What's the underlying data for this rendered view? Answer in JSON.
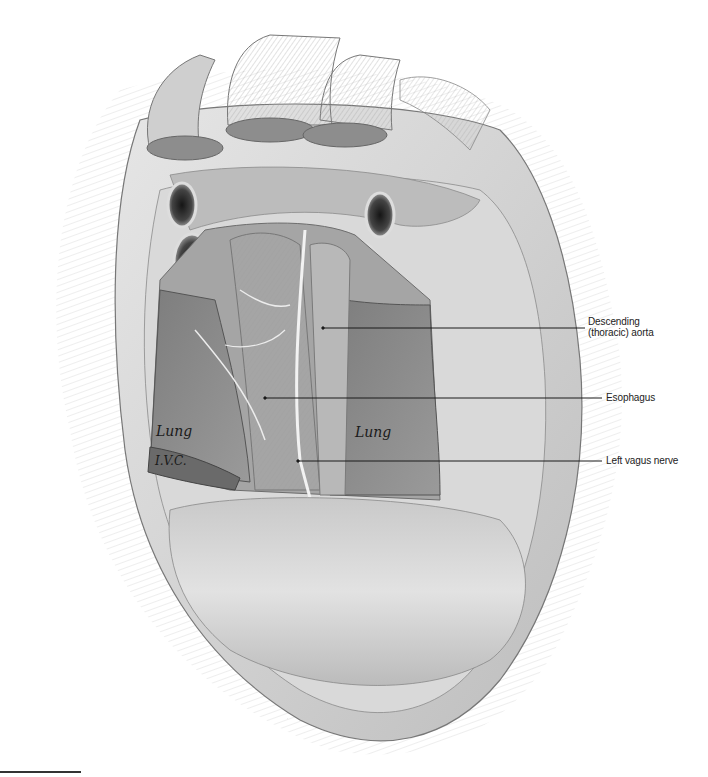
{
  "figure": {
    "style": "grayscale pencil anatomical illustration",
    "colors": {
      "background": "#ffffff",
      "leader": "#1a1a1a",
      "text": "#222222"
    }
  },
  "labels": [
    {
      "id": "descending-aorta",
      "line1": "Descending",
      "line2": "(thoracic) aorta"
    },
    {
      "id": "esophagus",
      "line1": "Esophagus"
    },
    {
      "id": "left-vagus-nerve",
      "line1": "Left vagus nerve"
    }
  ],
  "inline_labels": {
    "lung_left": "Lung",
    "lung_right": "Lung",
    "ivc": "I.V.C."
  }
}
